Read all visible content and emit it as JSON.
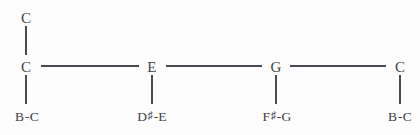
{
  "diagram": {
    "type": "note-chain-tree",
    "background_color": "#fdfdfd",
    "line_color": "#4a4a52",
    "text_color": "#3f3f46",
    "top_node": {
      "label": "C",
      "x": 26,
      "y": 18
    },
    "nodes": [
      {
        "id": "node-1",
        "label": "C",
        "x": 26,
        "y": 67,
        "sub_label_prefix": "B",
        "sub_label_sharp": "",
        "sub_label_suffix": "-C",
        "sub_label_full": "B-C",
        "sub_x": 27,
        "sub_y": 117
      },
      {
        "id": "node-2",
        "label": "E",
        "x": 152,
        "y": 67,
        "sub_label_prefix": "D",
        "sub_label_sharp": "♯",
        "sub_label_suffix": "-E",
        "sub_label_full": "D♯-E",
        "sub_x": 152,
        "sub_y": 117
      },
      {
        "id": "node-3",
        "label": "G",
        "x": 276,
        "y": 67,
        "sub_label_prefix": "F",
        "sub_label_sharp": "♯",
        "sub_label_suffix": "-G",
        "sub_label_full": "F♯-G",
        "sub_x": 277,
        "sub_y": 117
      },
      {
        "id": "node-4",
        "label": "C",
        "x": 400,
        "y": 67,
        "sub_label_prefix": "B",
        "sub_label_sharp": "",
        "sub_label_suffix": "-C",
        "sub_label_full": "B-C",
        "sub_x": 400,
        "sub_y": 117
      }
    ],
    "horizontal_edges": [
      {
        "id": "edge-c-e",
        "left": 41,
        "top": 65,
        "width": 98,
        "from": "C",
        "to": "E"
      },
      {
        "id": "edge-e-g",
        "left": 166,
        "top": 65,
        "width": 96,
        "from": "E",
        "to": "G"
      },
      {
        "id": "edge-g-c",
        "left": 290,
        "top": 65,
        "width": 96,
        "from": "G",
        "to": "C"
      }
    ],
    "vertical_edges": [
      {
        "id": "edge-top-c",
        "left": 26,
        "top": 26,
        "height": 29,
        "from": "C",
        "to": "C"
      },
      {
        "id": "edge-c-bc",
        "left": 26,
        "top": 75,
        "height": 29,
        "from": "C",
        "to": "B-C"
      },
      {
        "id": "edge-e-dse",
        "left": 152,
        "top": 75,
        "height": 29,
        "from": "E",
        "to": "D♯-E"
      },
      {
        "id": "edge-g-fsg",
        "left": 276,
        "top": 75,
        "height": 29,
        "from": "G",
        "to": "F♯-G"
      },
      {
        "id": "edge-c2-bc",
        "left": 400,
        "top": 75,
        "height": 29,
        "from": "C",
        "to": "B-C"
      }
    ]
  }
}
